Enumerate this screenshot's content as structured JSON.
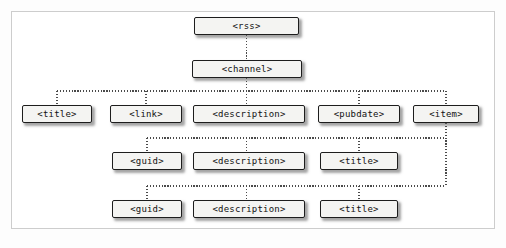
{
  "diagram": {
    "type": "tree",
    "frame": {
      "border_color": "#cdcdcd",
      "background": "#ffffff"
    },
    "style": {
      "node_fill": "#f4f4f2",
      "node_border": "#1d1d1d",
      "connector_color": "#4a4a4a",
      "connector_style": "dotted"
    },
    "nodes": [
      {
        "id": "rss",
        "label": "<rss>",
        "x": 194,
        "y": 17,
        "w": 105,
        "level": 0
      },
      {
        "id": "channel",
        "label": "<channel>",
        "x": 192,
        "y": 60,
        "w": 110,
        "level": 1
      },
      {
        "id": "ch-title",
        "label": "<title>",
        "x": 22,
        "y": 105,
        "w": 70,
        "level": 2
      },
      {
        "id": "ch-link",
        "label": "<link>",
        "x": 110,
        "y": 105,
        "w": 72,
        "level": 2
      },
      {
        "id": "ch-desc",
        "label": "<description>",
        "x": 193,
        "y": 105,
        "w": 112,
        "level": 2
      },
      {
        "id": "ch-pubdate",
        "label": "<pubdate>",
        "x": 318,
        "y": 105,
        "w": 82,
        "level": 2
      },
      {
        "id": "ch-item",
        "label": "<item>",
        "x": 413,
        "y": 105,
        "w": 66,
        "level": 2
      },
      {
        "id": "it1-guid",
        "label": "<guid>",
        "x": 112,
        "y": 152,
        "w": 70,
        "level": 3
      },
      {
        "id": "it1-desc",
        "label": "<description>",
        "x": 193,
        "y": 152,
        "w": 112,
        "level": 3
      },
      {
        "id": "it1-title",
        "label": "<title>",
        "x": 320,
        "y": 152,
        "w": 78,
        "level": 3
      },
      {
        "id": "it2-guid",
        "label": "<guid>",
        "x": 112,
        "y": 200,
        "w": 70,
        "level": 4
      },
      {
        "id": "it2-desc",
        "label": "<description>",
        "x": 193,
        "y": 200,
        "w": 112,
        "level": 4
      },
      {
        "id": "it2-title",
        "label": "<title>",
        "x": 320,
        "y": 200,
        "w": 78,
        "level": 4
      }
    ],
    "edges": [
      {
        "from": "rss",
        "to": "channel"
      },
      {
        "from": "channel",
        "to": "ch-title"
      },
      {
        "from": "channel",
        "to": "ch-link"
      },
      {
        "from": "channel",
        "to": "ch-desc"
      },
      {
        "from": "channel",
        "to": "ch-pubdate"
      },
      {
        "from": "channel",
        "to": "ch-item"
      },
      {
        "from": "ch-item",
        "to": "it1-guid"
      },
      {
        "from": "ch-item",
        "to": "it1-desc"
      },
      {
        "from": "ch-item",
        "to": "it1-title"
      },
      {
        "from": "ch-item",
        "to": "it2-guid"
      },
      {
        "from": "ch-item",
        "to": "it2-desc"
      },
      {
        "from": "ch-item",
        "to": "it2-title"
      }
    ]
  }
}
